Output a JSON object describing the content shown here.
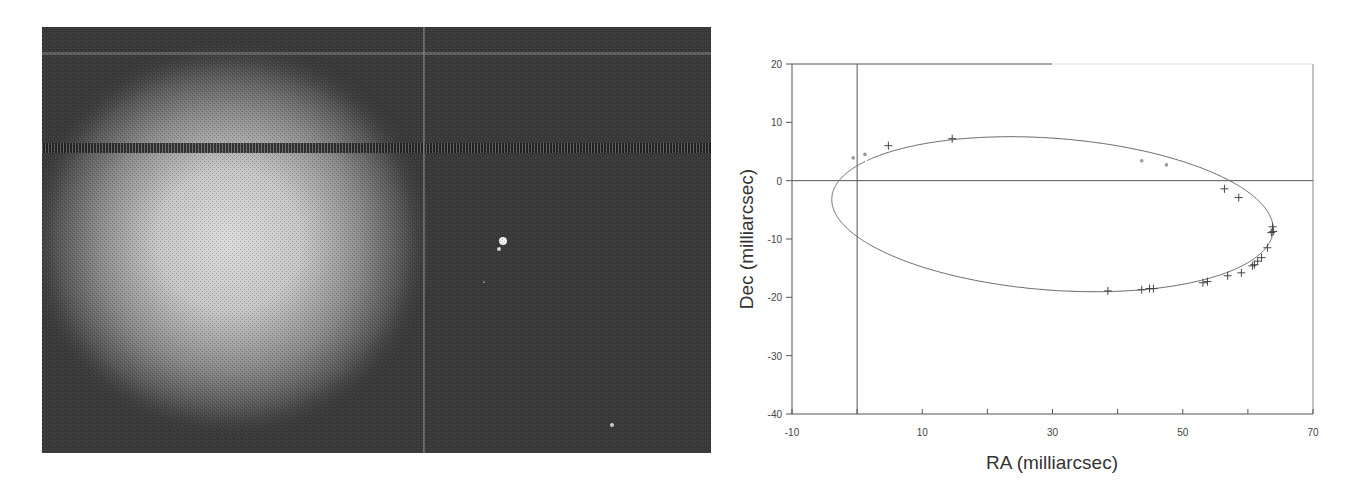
{
  "figure": {
    "left_panel": {
      "description": "astronomical-image",
      "background": "#3a3a3a",
      "glow_center": [
        230,
        240
      ],
      "bright_star": [
        503,
        241
      ],
      "companion_star": [
        499,
        249
      ],
      "faint_star_1": [
        484,
        282
      ],
      "faint_star_2": [
        612,
        425
      ],
      "vertical_line_x": 424,
      "light_streak_y": 53,
      "dark_streak_y": 148
    }
  },
  "chart_data": {
    "type": "scatter",
    "title": "",
    "xlabel": "RA (milliarcsec)",
    "ylabel": "Dec (milliarcsec)",
    "xlim": [
      -10,
      70
    ],
    "ylim": [
      -40,
      20
    ],
    "xticks": [
      -10,
      0,
      10,
      20,
      30,
      40,
      50,
      60,
      70
    ],
    "xtick_labels": [
      "-10",
      "",
      "10",
      "",
      "30",
      "",
      "50",
      "",
      "70"
    ],
    "yticks": [
      20,
      10,
      0,
      -10,
      -20,
      -30,
      -40
    ],
    "ytick_labels": [
      "20",
      "10",
      "0",
      "-10",
      "-20",
      "-30",
      "-40"
    ],
    "grid": false,
    "reference_lines": {
      "x": 0,
      "y": 0
    },
    "orbit": {
      "type": "ellipse",
      "center": [
        30.0,
        -5.75
      ],
      "semi_x": 34.0,
      "semi_y": 13.0,
      "rotation_deg": -5,
      "gaps": [
        [
          -0.6,
          3.9,
          1.2,
          4.5
        ],
        [
          43.7,
          3.4,
          47.5,
          2.7
        ]
      ]
    },
    "series": [
      {
        "name": "observations",
        "marker": "+",
        "points": [
          [
            4.8,
            6.0
          ],
          [
            14.6,
            7.2
          ],
          [
            56.4,
            -1.4
          ],
          [
            58.6,
            -2.9
          ],
          [
            63.8,
            -7.9
          ],
          [
            63.6,
            -8.9
          ],
          [
            63.9,
            -8.7
          ],
          [
            63.0,
            -11.5
          ],
          [
            62.1,
            -13.2
          ],
          [
            61.5,
            -13.8
          ],
          [
            61.0,
            -14.4
          ],
          [
            60.7,
            -14.6
          ],
          [
            59.0,
            -15.8
          ],
          [
            56.9,
            -16.3
          ],
          [
            53.8,
            -17.3
          ],
          [
            53.1,
            -17.5
          ],
          [
            45.5,
            -18.5
          ],
          [
            44.9,
            -18.5
          ],
          [
            43.7,
            -18.7
          ],
          [
            38.5,
            -18.9
          ]
        ]
      },
      {
        "name": "segment-endpoints",
        "marker": "dot",
        "points": [
          [
            1.2,
            4.5
          ],
          [
            43.7,
            3.4
          ],
          [
            47.5,
            2.7
          ],
          [
            -0.6,
            3.9
          ]
        ]
      }
    ]
  }
}
